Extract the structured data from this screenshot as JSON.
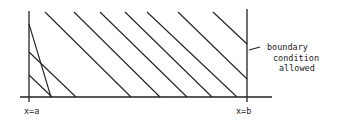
{
  "diagram": {
    "left_label": "x=a",
    "right_label": "x=b",
    "annotation": {
      "line1": "boundary",
      "line2": "condition",
      "line3": "allowed"
    },
    "colors": {
      "ink": "#222222",
      "background": "#ffffff"
    },
    "hatch_lines": [
      [
        29,
        24,
        51,
        97
      ],
      [
        29,
        52,
        76,
        97
      ],
      [
        29,
        75,
        52,
        97
      ],
      [
        45,
        12,
        131,
        97
      ],
      [
        74,
        12,
        160,
        97
      ],
      [
        100,
        12,
        187,
        97
      ],
      [
        125,
        12,
        212,
        97
      ],
      [
        147,
        12,
        237,
        97
      ],
      [
        178,
        12,
        247,
        79
      ],
      [
        213,
        12,
        247,
        44
      ]
    ]
  }
}
